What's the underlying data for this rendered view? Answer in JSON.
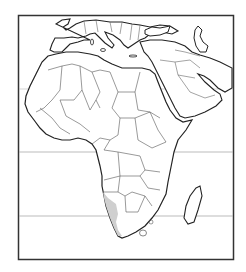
{
  "map": {
    "subject": "Africa and Middle East political outline map",
    "highlight_region": "Namib Desert (southwestern Africa coast)",
    "colors": {
      "background": "#ffffff",
      "frame": "#333333",
      "coastline": "#222222",
      "borders": "#555555",
      "latitude_lines": "#aaaaaa",
      "highlight": "#cfcfcf"
    }
  }
}
